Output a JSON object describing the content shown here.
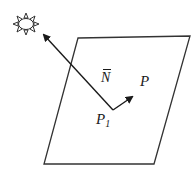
{
  "diagram": {
    "labels": {
      "normal": "N",
      "point": "P",
      "point1_base": "P",
      "point1_sub": "1"
    },
    "colors": {
      "stroke": "#333333",
      "background": "#ffffff"
    },
    "elements": [
      {
        "type": "light-source",
        "label": "sun"
      },
      {
        "type": "plane",
        "shape": "parallelogram"
      },
      {
        "type": "vector",
        "name": "normal",
        "from": "P1",
        "to": "light-source"
      },
      {
        "type": "vector",
        "name": "P1-to-P",
        "from": "P1",
        "to": "P"
      }
    ]
  }
}
